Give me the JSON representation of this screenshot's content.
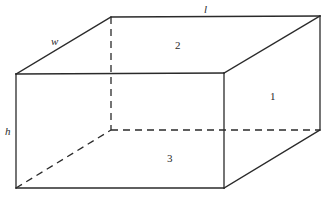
{
  "diagram": {
    "title": "",
    "type": "rectangular-prism",
    "colors": {
      "stroke": "#2a2a2a",
      "background": "#ffffff"
    },
    "vertices": {
      "front_top_left": [
        16,
        74
      ],
      "front_top_right": [
        224,
        73
      ],
      "front_bottom_left": [
        16,
        188
      ],
      "front_bottom_right": [
        224,
        188
      ],
      "back_top_left": [
        111,
        17
      ],
      "back_top_right": [
        320,
        16
      ],
      "back_bottom_left": [
        111,
        130
      ],
      "back_bottom_right": [
        320,
        130
      ]
    },
    "dimension_labels": {
      "length": "l",
      "width": "w",
      "height": "h"
    },
    "face_labels": {
      "right": "1",
      "top": "2",
      "bottom": "3"
    }
  }
}
